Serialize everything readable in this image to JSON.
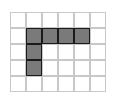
{
  "grid": {
    "rows": 5,
    "cols": 6,
    "cell_size": 16,
    "line_color": "#c8c8c8",
    "fill_color": "#7a7a7a",
    "fill_border_color": "#1a1a1a",
    "filled_cells": [
      {
        "row": 1,
        "col": 1
      },
      {
        "row": 1,
        "col": 2
      },
      {
        "row": 1,
        "col": 3
      },
      {
        "row": 1,
        "col": 4
      },
      {
        "row": 2,
        "col": 1
      },
      {
        "row": 3,
        "col": 1
      }
    ]
  }
}
